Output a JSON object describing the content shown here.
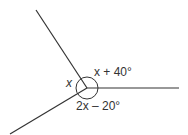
{
  "diagram": {
    "type": "angles-around-a-point",
    "vertex": {
      "x": 87,
      "y": 88
    },
    "rays": [
      {
        "name": "upper-left",
        "end": {
          "x": 36,
          "y": 10
        }
      },
      {
        "name": "right",
        "end": {
          "x": 179,
          "y": 88
        }
      },
      {
        "name": "lower-left",
        "end": {
          "x": 10,
          "y": 134
        }
      }
    ],
    "angle_arc": {
      "shape": "full-circle",
      "radius": 11
    },
    "labels": {
      "left_angle": "x",
      "upper_angle": "x + 40°",
      "lower_angle": "2x – 20°"
    },
    "line_color": "#333333"
  }
}
